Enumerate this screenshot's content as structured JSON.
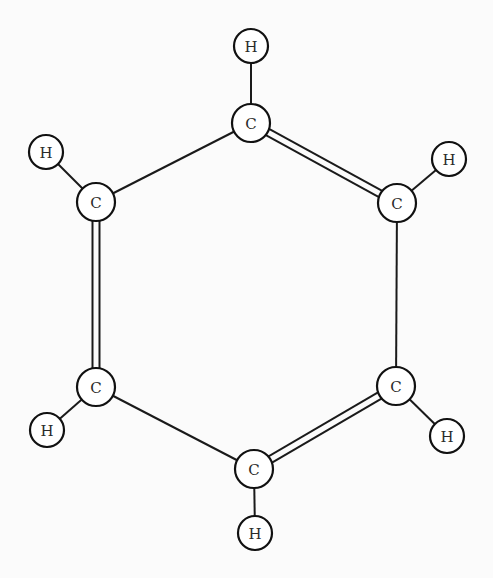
{
  "diagram": {
    "title": "",
    "molecule": "benzene (Kekulé structure)",
    "colors": {
      "line": "#1a1a1a",
      "atom_fill": "#ffffff",
      "text": "#2a2a2a",
      "background": "#fbfbfb"
    },
    "atoms": [
      {
        "id": "C1",
        "element": "C",
        "label": "C",
        "x": 251,
        "y": 123,
        "r": 19
      },
      {
        "id": "C2",
        "element": "C",
        "label": "C",
        "x": 397,
        "y": 203,
        "r": 19
      },
      {
        "id": "C3",
        "element": "C",
        "label": "C",
        "x": 396,
        "y": 386,
        "r": 19
      },
      {
        "id": "C4",
        "element": "C",
        "label": "C",
        "x": 254,
        "y": 469,
        "r": 19
      },
      {
        "id": "C5",
        "element": "C",
        "label": "C",
        "x": 96,
        "y": 387,
        "r": 19
      },
      {
        "id": "C6",
        "element": "C",
        "label": "C",
        "x": 96,
        "y": 202,
        "r": 19
      },
      {
        "id": "H1",
        "element": "H",
        "label": "H",
        "x": 251,
        "y": 46,
        "r": 17
      },
      {
        "id": "H2",
        "element": "H",
        "label": "H",
        "x": 449,
        "y": 159,
        "r": 17
      },
      {
        "id": "H3",
        "element": "H",
        "label": "H",
        "x": 447,
        "y": 436,
        "r": 17
      },
      {
        "id": "H4",
        "element": "H",
        "label": "H",
        "x": 255,
        "y": 533,
        "r": 17
      },
      {
        "id": "H5",
        "element": "H",
        "label": "H",
        "x": 47,
        "y": 430,
        "r": 17
      },
      {
        "id": "H6",
        "element": "H",
        "label": "H",
        "x": 46,
        "y": 152,
        "r": 17
      }
    ],
    "bonds": [
      {
        "from": "C1",
        "to": "C2",
        "order": 2
      },
      {
        "from": "C2",
        "to": "C3",
        "order": 1
      },
      {
        "from": "C3",
        "to": "C4",
        "order": 2
      },
      {
        "from": "C4",
        "to": "C5",
        "order": 1
      },
      {
        "from": "C5",
        "to": "C6",
        "order": 2
      },
      {
        "from": "C6",
        "to": "C1",
        "order": 1
      },
      {
        "from": "C1",
        "to": "H1",
        "order": 1
      },
      {
        "from": "C2",
        "to": "H2",
        "order": 1
      },
      {
        "from": "C3",
        "to": "H3",
        "order": 1
      },
      {
        "from": "C4",
        "to": "H4",
        "order": 1
      },
      {
        "from": "C5",
        "to": "H5",
        "order": 1
      },
      {
        "from": "C6",
        "to": "H6",
        "order": 1
      }
    ]
  }
}
